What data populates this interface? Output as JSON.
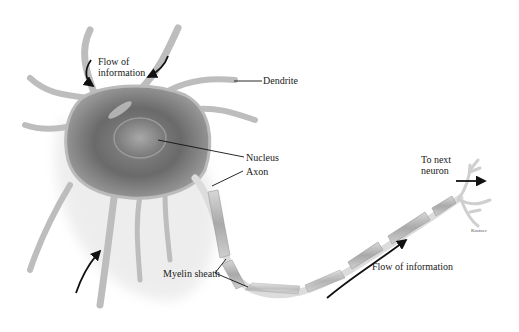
{
  "diagram": {
    "subject": "Neuron",
    "labels": {
      "flow_top_line1": "Flow of",
      "flow_top_line2": "information",
      "dendrite": "Dendrite",
      "nucleus": "Nucleus",
      "axon": "Axon",
      "to_next_line1": "To next",
      "to_next_line2": "neuron",
      "myelin": "Myelin sheath",
      "flow_bottom": "Flow of information",
      "credit": "Kastner"
    },
    "colors": {
      "cell_body": "#6f6f6f",
      "membrane": "#c9c9c9",
      "myelin": "#b8b8b8",
      "axon": "#dcdcdc",
      "leader_line": "#111111",
      "arrow": "#111111"
    }
  }
}
